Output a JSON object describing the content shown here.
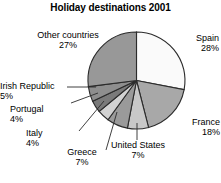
{
  "chart": {
    "title": "Holiday destinations 2001"
  },
  "chart_data": {
    "type": "pie",
    "title": "Holiday destinations 2001",
    "xlabel": "",
    "ylabel": "",
    "unit": "%",
    "start_angle_deg": 0,
    "direction": "clockwise",
    "legend": "none",
    "grid": false,
    "categories": [
      "Spain",
      "France",
      "United States",
      "Greece",
      "Italy",
      "Portugal",
      "Irish Republic",
      "Other countries"
    ],
    "values": [
      28,
      18,
      7,
      7,
      4,
      4,
      5,
      27
    ],
    "total": 100,
    "slices": [
      {
        "label": "Spain",
        "value": 28,
        "pct_text": "28%",
        "color": "#fafafa"
      },
      {
        "label": "France",
        "value": 18,
        "pct_text": "18%",
        "color": "#a8a8a8"
      },
      {
        "label": "United States",
        "value": 7,
        "pct_text": "7%",
        "color": "#c8c8c8"
      },
      {
        "label": "Greece",
        "value": 7,
        "pct_text": "7%",
        "color": "#9a9a9a"
      },
      {
        "label": "Italy",
        "value": 4,
        "pct_text": "4%",
        "color": "#d2d2d2"
      },
      {
        "label": "Portugal",
        "value": 4,
        "pct_text": "4%",
        "color": "#7a7a7a"
      },
      {
        "label": "Irish Republic",
        "value": 5,
        "pct_text": "5%",
        "color": "#8e8e8e"
      },
      {
        "label": "Other countries",
        "value": 27,
        "pct_text": "27%",
        "color": "#989898"
      }
    ],
    "colors": {
      "outline": "#2b2b2b",
      "leader_line": "#2b2b2b",
      "background": "#ffffff",
      "text": "#000000"
    }
  }
}
